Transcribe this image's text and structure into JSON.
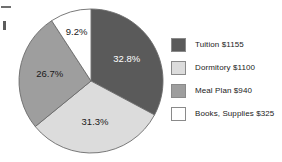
{
  "chart_data": {
    "type": "pie",
    "title": "",
    "subtitle": "",
    "xlabel": "",
    "ylabel": "",
    "legend_position": "right",
    "start_angle_deg": 0,
    "direction": "clockwise",
    "categories": [
      "Tuition",
      "Dormitory",
      "Meal Plan",
      "Books, Supplies"
    ],
    "values": [
      1155,
      1100,
      940,
      325
    ],
    "percentages": [
      32.8,
      31.3,
      26.7,
      9.2
    ],
    "slices": [
      {
        "name": "Tuition",
        "legend_label": "Tuition $1155",
        "amount": "$1155",
        "value": 1155,
        "percent_label": "32.8%",
        "percent": 32.8,
        "color": "#5a5a5a",
        "label_color": "#ffffff"
      },
      {
        "name": "Dormitory",
        "legend_label": "Dormitory $1100",
        "amount": "$1100",
        "value": 1100,
        "percent_label": "31.3%",
        "percent": 31.3,
        "color": "#dcdcdc",
        "label_color": "#1a1a1a"
      },
      {
        "name": "Meal Plan",
        "legend_label": "Meal Plan $940",
        "amount": "$940",
        "value": 940,
        "percent_label": "26.7%",
        "percent": 26.7,
        "color": "#9e9e9e",
        "label_color": "#1a1a1a"
      },
      {
        "name": "Books, Supplies",
        "legend_label": "Books, Supplies $325",
        "amount": "$325",
        "value": 325,
        "percent_label": "9.2%",
        "percent": 9.2,
        "color": "#ffffff",
        "label_color": "#1a1a1a"
      }
    ]
  },
  "legend": {
    "items": [
      {
        "label": "Tuition $1155",
        "color": "#5a5a5a"
      },
      {
        "label": "Dormitory $1100",
        "color": "#dcdcdc"
      },
      {
        "label": "Meal Plan $940",
        "color": "#9e9e9e"
      },
      {
        "label": "Books, Supplies $325",
        "color": "#ffffff"
      }
    ]
  }
}
